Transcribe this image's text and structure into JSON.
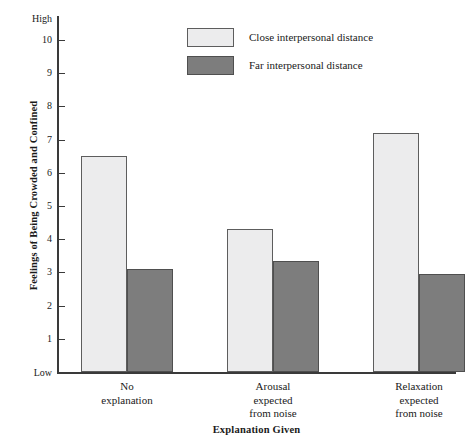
{
  "chart_data": {
    "type": "bar",
    "title": "",
    "xlabel": "Explanation Given",
    "ylabel": "Feelings of Being Crowded and Confined",
    "categories": [
      "No explanation",
      "Arousal expected from noise",
      "Relaxation expected from noise"
    ],
    "category_lines": [
      [
        "No",
        "explanation"
      ],
      [
        "Arousal",
        "expected",
        "from noise"
      ],
      [
        "Relaxation",
        "expected",
        "from noise"
      ]
    ],
    "series": [
      {
        "name": "Close interpersonal distance",
        "values": [
          6.5,
          4.3,
          7.2
        ],
        "color": "#ececed"
      },
      {
        "name": "Far interpersonal distance",
        "values": [
          3.1,
          3.35,
          2.95
        ],
        "color": "#7d7d7d"
      }
    ],
    "ylim": [
      0,
      10.6
    ],
    "yticks": [
      1,
      2,
      3,
      4,
      5,
      6,
      7,
      8,
      9,
      10
    ],
    "ytick_labels": [
      "1",
      "2",
      "3",
      "4",
      "5",
      "6",
      "7",
      "8",
      "9",
      "10"
    ],
    "y_axis_low_label": "Low",
    "y_axis_high_label": "High",
    "grid": false,
    "legend_position": "top-center"
  },
  "axes": {
    "y_title": "Feelings of Being Crowded and Confined",
    "x_title": "Explanation Given",
    "low": "Low",
    "high": "High"
  },
  "legend": {
    "items": [
      {
        "label": "Close interpersonal distance",
        "swatch": "close"
      },
      {
        "label": "Far interpersonal distance",
        "swatch": "far"
      }
    ]
  },
  "ticks": {
    "values": [
      "10",
      "9",
      "8",
      "7",
      "6",
      "5",
      "4",
      "3",
      "2",
      "1"
    ]
  },
  "groups": [
    {
      "line1": "No",
      "line2": "explanation",
      "line3": ""
    },
    {
      "line1": "Arousal",
      "line2": "expected",
      "line3": "from noise"
    },
    {
      "line1": "Relaxation",
      "line2": "expected",
      "line3": "from noise"
    }
  ]
}
